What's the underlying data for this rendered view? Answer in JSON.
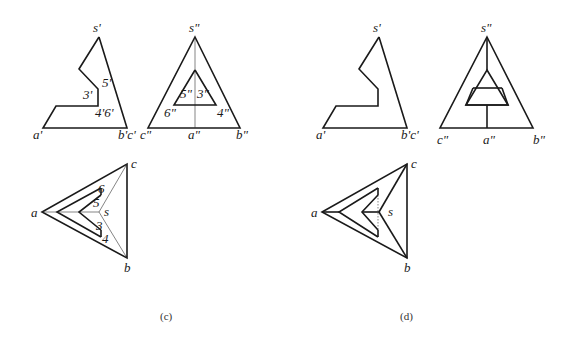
{
  "figure_c": {
    "caption": "(c)",
    "front_view": {
      "labels": {
        "apex": "s'",
        "left": "a'",
        "right": "b'c'",
        "notch_upper": "5'",
        "notch_mid": "3'",
        "notch_lower": "4'6'"
      }
    },
    "side_view": {
      "labels": {
        "apex": "s\"",
        "left": "c\"",
        "center": "a\"",
        "right": "b\"",
        "inner_upper_left": "5\"",
        "inner_upper_right": "3\"",
        "inner_lower_left": "6\"",
        "inner_lower_right": "4\""
      }
    },
    "top_view": {
      "labels": {
        "apex_c": "c",
        "left_a": "a",
        "bottom_b": "b",
        "center_s": "s",
        "p6": "6",
        "p5": "5",
        "p3": "3",
        "p4": "4"
      }
    }
  },
  "figure_d": {
    "caption": "(d)",
    "front_view": {
      "labels": {
        "apex": "s'",
        "left": "a'",
        "right": "b'c'"
      }
    },
    "side_view": {
      "labels": {
        "apex": "s\"",
        "left": "c\"",
        "center": "a\"",
        "right": "b\""
      }
    },
    "top_view": {
      "labels": {
        "apex_c": "c",
        "left_a": "a",
        "bottom_b": "b",
        "center_s": "s"
      }
    }
  }
}
